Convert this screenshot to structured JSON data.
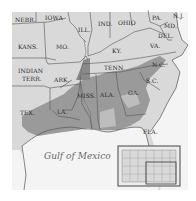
{
  "map": {
    "water_label": "Gulf of Mexico",
    "colors": {
      "land": "#d9d9d9",
      "shaded_belt": "#9a9a9a",
      "dark_belt": "#7e7e7e",
      "water": "#f4f4f4",
      "border": "#555555"
    },
    "states": [
      {
        "label": "NEBR."
      },
      {
        "label": "IOWA"
      },
      {
        "label": "ILL."
      },
      {
        "label": "IND."
      },
      {
        "label": "OHIO"
      },
      {
        "label": "PA."
      },
      {
        "label": "N.J."
      },
      {
        "label": "MD."
      },
      {
        "label": "DEL."
      },
      {
        "label": "VA."
      },
      {
        "label": "KY."
      },
      {
        "label": "KANS."
      },
      {
        "label": "MO."
      },
      {
        "label": "TENN."
      },
      {
        "label": "N.C."
      },
      {
        "label": "S.C."
      },
      {
        "label": "INDIAN"
      },
      {
        "label": "TERR."
      },
      {
        "label": "ARK."
      },
      {
        "label": "MISS."
      },
      {
        "label": "ALA."
      },
      {
        "label": "GA."
      },
      {
        "label": "TEX."
      },
      {
        "label": "LA."
      },
      {
        "label": "FLA."
      }
    ],
    "inset": {
      "description": "locator map of United States with highlighted southeast region"
    }
  }
}
